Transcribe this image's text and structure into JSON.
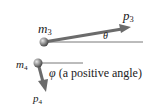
{
  "diagram": {
    "top": {
      "mass_label": "m",
      "mass_sub": "3",
      "momentum_label": "p",
      "momentum_sub": "3",
      "angle_label": "θ"
    },
    "bottom": {
      "mass_label": "m",
      "mass_sub": "4",
      "momentum_label": "p",
      "momentum_sub": "4",
      "angle_label": "φ",
      "angle_note": "(a positive angle)"
    },
    "colors": {
      "arrow": "#6b6b6b",
      "ball": "#8a8a8a",
      "line": "#555555",
      "text": "#222222"
    }
  }
}
